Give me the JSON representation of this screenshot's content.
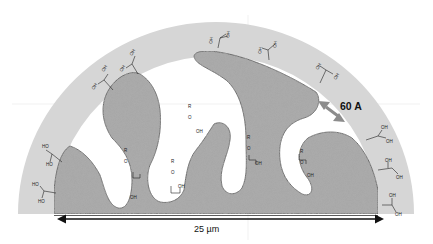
{
  "diagram": {
    "type": "porous-particle-cross-section",
    "labels": {
      "pore_size": "60 A",
      "particle_width": "25 µm"
    },
    "surface_groups": {
      "outer": "OH",
      "outer_left": "HO",
      "bonded": "R",
      "linker": "O"
    },
    "colors": {
      "shell": "#d6d6d6",
      "particle": "#a8a8a8",
      "particle_outline": "#555555",
      "arrow": "#8c8c8c",
      "scale_bar": "#111111",
      "background": "#ffffff"
    }
  }
}
